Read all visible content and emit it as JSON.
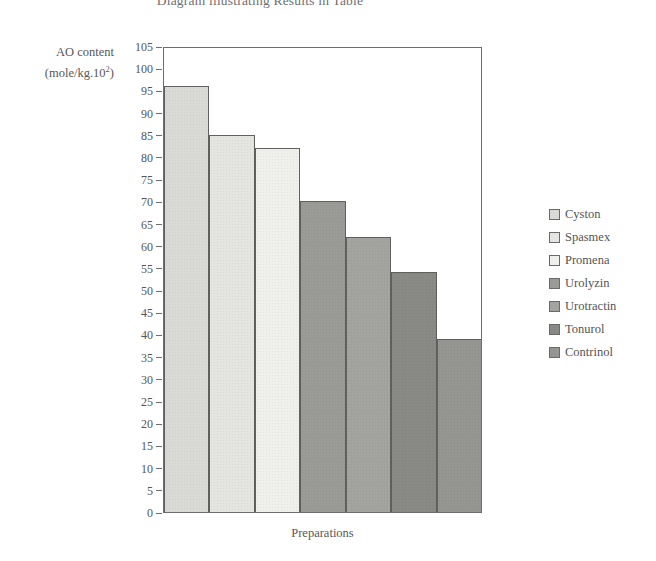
{
  "chart_data": {
    "type": "bar",
    "title": "Diagram illustrating Results in Table",
    "xlabel": "Preparations",
    "ylabel": "AO content (mole/kg.10²)",
    "ylabel_line1": "AO content",
    "ylabel_line2_prefix": "(mole/kg.10",
    "ylabel_line2_sup": "2",
    "ylabel_line2_suffix": ")",
    "categories": [
      "Cyston",
      "Spasmex",
      "Promena",
      "Urolyzin",
      "Urotractin",
      "Tonurol",
      "Contrinol"
    ],
    "values": [
      96,
      85,
      82,
      70,
      62,
      54,
      39
    ],
    "colors": [
      "#d9d9d6",
      "#e4e4e0",
      "#efefeb",
      "#9a9a97",
      "#a3a3a0",
      "#898986",
      "#959592"
    ],
    "ylim": [
      0,
      105
    ],
    "ytick_step": 5,
    "yticks": [
      105,
      100,
      95,
      90,
      85,
      80,
      75,
      70,
      65,
      60,
      55,
      50,
      45,
      40,
      35,
      30,
      25,
      20,
      15,
      10,
      5,
      0
    ],
    "grid": false,
    "legend_position": "right"
  },
  "legend": {
    "items": [
      {
        "label": "Cyston",
        "color": "#d9d9d6"
      },
      {
        "label": "Spasmex",
        "color": "#e4e4e0"
      },
      {
        "label": "Promena",
        "color": "#efefeb"
      },
      {
        "label": "Urolyzin",
        "color": "#9a9a97"
      },
      {
        "label": "Urotractin",
        "color": "#a3a3a0"
      },
      {
        "label": "Tonurol",
        "color": "#898986"
      },
      {
        "label": "Contrinol",
        "color": "#959592"
      }
    ]
  }
}
